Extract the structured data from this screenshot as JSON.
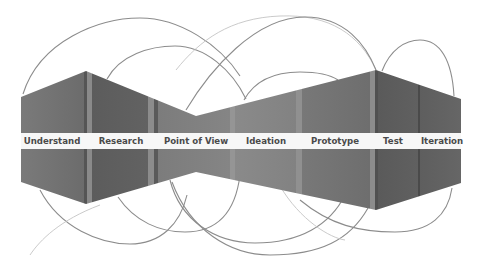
{
  "diagram": {
    "type": "design-thinking-process",
    "stages": [
      {
        "label": "Understand",
        "x": 52
      },
      {
        "label": "Research",
        "x": 121
      },
      {
        "label": "Point of View",
        "x": 196
      },
      {
        "label": "Ideation",
        "x": 266
      },
      {
        "label": "Prototype",
        "x": 335
      },
      {
        "label": "Test",
        "x": 393
      },
      {
        "label": "Iteration",
        "x": 442
      }
    ],
    "colors": {
      "shape_fill": "#6e6e6e",
      "band_fill": "#f7f7f7",
      "label_text": "#4a4a4a",
      "arc_stroke": "#8c8c8c",
      "divider_light": "#8a8a8a",
      "divider_dark": "#555555"
    }
  }
}
